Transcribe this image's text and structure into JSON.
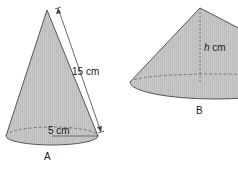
{
  "figure": {
    "cone_a": {
      "label": "A",
      "slant_label": "15 cm",
      "radius_label": "5 cm"
    },
    "cone_b": {
      "label": "B",
      "height_label_var": "h",
      "height_label_unit": " cm"
    },
    "colors": {
      "fill": "#c4c4c4",
      "stroke": "#555555",
      "text": "#222222"
    }
  }
}
